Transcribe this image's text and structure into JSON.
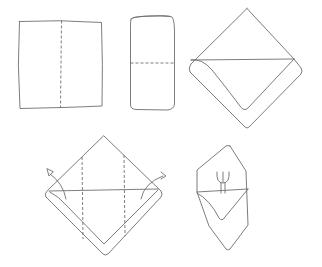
{
  "diagram": {
    "title": "Napkin folding steps",
    "stroke_color": "#6e6e6e",
    "background": "#ffffff",
    "steps": [
      {
        "index": 1,
        "label": "Square napkin with vertical center fold line"
      },
      {
        "index": 2,
        "label": "Folded in half into a rectangle with horizontal fold line"
      },
      {
        "index": 3,
        "label": "Diamond shape with top layer folded down"
      },
      {
        "index": 4,
        "label": "Diamond with two vertical fold lines; side corners folded back (arrows)"
      },
      {
        "index": 5,
        "label": "Finished pocket napkin holding a fork"
      }
    ]
  }
}
